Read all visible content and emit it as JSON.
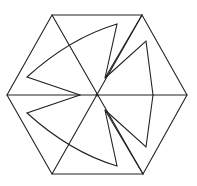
{
  "diagram": {
    "title": "",
    "stroke_color": "#222222",
    "background": "#ffffff",
    "hexagon": {
      "vertices": [
        [
          52,
          15
        ],
        [
          142,
          15
        ],
        [
          187,
          95
        ],
        [
          143,
          174
        ],
        [
          52,
          174
        ],
        [
          7,
          95
        ]
      ],
      "center": [
        97,
        95
      ]
    },
    "diagonals": [
      {
        "from": [
          52,
          15
        ],
        "to": [
          143,
          174
        ]
      },
      {
        "from": [
          142,
          15
        ],
        "to": [
          52,
          174
        ]
      },
      {
        "from": [
          7,
          95
        ],
        "to": [
          187,
          95
        ]
      }
    ],
    "pinwheel_paths": [
      {
        "name": "upper-left-blade",
        "d": "M80,95 L27,77 Q70,38 117,24 L105,78"
      },
      {
        "name": "upper-right-blade",
        "d": "M142,15 L105,78 L146,41 L153,95"
      },
      {
        "name": "lower-left-blade",
        "d": "M80,95 L27,113 Q70,152 117,166 L105,110"
      },
      {
        "name": "lower-right-blade",
        "d": "M143,174 L105,110 L146,147 L153,95"
      }
    ]
  }
}
